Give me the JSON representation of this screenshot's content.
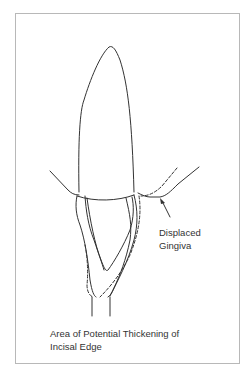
{
  "diagram": {
    "labels": {
      "displaced_gingiva_line1": "Displaced",
      "displaced_gingiva_line2": "Gingiva",
      "area_line1": "Area of Potential Thickening of",
      "area_line2": "Incisal Edge"
    },
    "colors": {
      "line": "#333333",
      "frame": "#b8b8b8",
      "background": "#ffffff"
    }
  }
}
